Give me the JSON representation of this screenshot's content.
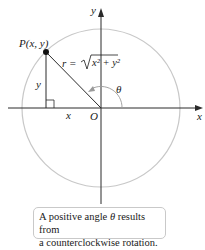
{
  "diagram": {
    "point_label": "P(x, y)",
    "radius_label": "r = ",
    "radius_expr": "x² + y²",
    "y_leg_label": "y",
    "x_leg_label": "x",
    "origin_label": "O",
    "angle_label": "θ",
    "x_axis_label": "x",
    "y_axis_label": "y",
    "colors": {
      "axis": "#2a2a2a",
      "circle": "#c8c8c8",
      "radius": "#2a2a2a",
      "point": "#111111",
      "callout_border": "#c9c9c9"
    }
  },
  "callout": {
    "line1_pre": "A positive angle ",
    "line1_theta": "θ",
    "line1_post": " results from",
    "line2": "a counterclockwise rotation."
  }
}
